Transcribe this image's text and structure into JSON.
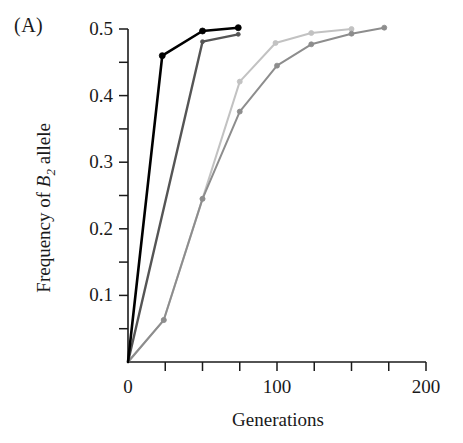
{
  "figure": {
    "panel_label": "(A)",
    "xlabel": "Generations",
    "ylabel_prefix": "Frequency of ",
    "ylabel_italic": "B",
    "ylabel_sub": "2",
    "ylabel_suffix": " allele"
  },
  "chart_data": {
    "type": "line",
    "title": "",
    "panel": "(A)",
    "xlabel": "Generations",
    "ylabel": "Frequency of B2 allele",
    "xlim": [
      0,
      200
    ],
    "ylim": [
      0,
      0.5
    ],
    "xticks": [
      0,
      100,
      200
    ],
    "xticklabels": [
      "0",
      "100",
      "200"
    ],
    "xminor_ticks": [
      25,
      50,
      75,
      125,
      150,
      175
    ],
    "yticks": [
      0.1,
      0.2,
      0.3,
      0.4,
      0.5
    ],
    "yticklabels": [
      "0.1",
      "0.2",
      "0.3",
      "0.4",
      "0.5"
    ],
    "yminor_ticks": [
      0.05,
      0.15,
      0.25,
      0.35,
      0.45
    ],
    "grid": false,
    "legend": "none",
    "marker": "circle",
    "series": [
      {
        "name": "replicate-1-black",
        "color": "#000000",
        "linewidth": 2.6,
        "marker_size": 6,
        "x": [
          0,
          23,
          50,
          74
        ],
        "y": [
          0.0,
          0.46,
          0.497,
          0.502
        ]
      },
      {
        "name": "replicate-2-dark-gray",
        "color": "#555555",
        "linewidth": 2.4,
        "marker_size": 4,
        "x": [
          0,
          50,
          74
        ],
        "y": [
          0.0,
          0.481,
          0.492
        ]
      },
      {
        "name": "replicate-3-medium-gray",
        "color": "#8d8d8d",
        "linewidth": 2.0,
        "marker_size": 5,
        "x": [
          0,
          24,
          50,
          75,
          100,
          123,
          150,
          172
        ],
        "y": [
          0.0,
          0.063,
          0.245,
          0.376,
          0.445,
          0.477,
          0.493,
          0.502
        ]
      },
      {
        "name": "replicate-4-light-gray",
        "color": "#c2c2c2",
        "linewidth": 2.0,
        "marker_size": 5,
        "x": [
          0,
          24,
          50,
          75,
          99,
          123,
          150
        ],
        "y": [
          0.0,
          0.063,
          0.245,
          0.421,
          0.479,
          0.494,
          0.5
        ]
      }
    ]
  }
}
